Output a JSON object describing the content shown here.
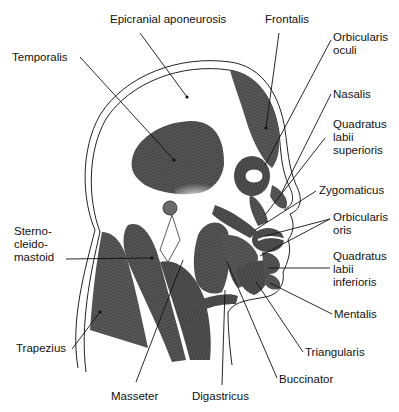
{
  "diagram": {
    "colors": {
      "muscle": "#4a4a4a",
      "muscle_dark": "#2e2e2e",
      "outline": "#222222",
      "bone": "#ffffff",
      "text": "#111111"
    },
    "labels": [
      {
        "id": "epicranial-aponeurosis",
        "text": "Epicranial aponeurosis",
        "x": 110,
        "y": 19
      },
      {
        "id": "frontalis",
        "text": "Frontalis",
        "x": 265,
        "y": 19
      },
      {
        "id": "orbicularis-oculi",
        "text": "Orbicularis\noculi",
        "x": 333,
        "y": 31
      },
      {
        "id": "temporalis",
        "text": "Temporalis",
        "x": 12,
        "y": 51
      },
      {
        "id": "nasalis",
        "text": "Nasalis",
        "x": 333,
        "y": 88
      },
      {
        "id": "quadratus-labii-superioris",
        "text": "Quadratus\nlabii\nsuperioris",
        "x": 333,
        "y": 118
      },
      {
        "id": "zygomaticus",
        "text": "Zygomaticus",
        "x": 319,
        "y": 184
      },
      {
        "id": "orbicularis-oris",
        "text": "Orbicularis\noris",
        "x": 333,
        "y": 211
      },
      {
        "id": "sterno-cleido-mastoid",
        "text": "Sterno-\ncleido-\nmastoid",
        "x": 14,
        "y": 225
      },
      {
        "id": "quadratus-labii-inferioris",
        "text": "Quadratus\nlabii\ninferioris",
        "x": 333,
        "y": 250
      },
      {
        "id": "mentalis",
        "text": "Mentalis",
        "x": 334,
        "y": 308
      },
      {
        "id": "trapezius",
        "text": "Trapezius",
        "x": 16,
        "y": 342
      },
      {
        "id": "triangularis",
        "text": "Triangularis",
        "x": 305,
        "y": 346
      },
      {
        "id": "buccinator",
        "text": "Buccinator",
        "x": 279,
        "y": 373
      },
      {
        "id": "masseter",
        "text": "Masseter",
        "x": 111,
        "y": 390
      },
      {
        "id": "digastricus",
        "text": "Digastricus",
        "x": 192,
        "y": 390
      }
    ]
  }
}
